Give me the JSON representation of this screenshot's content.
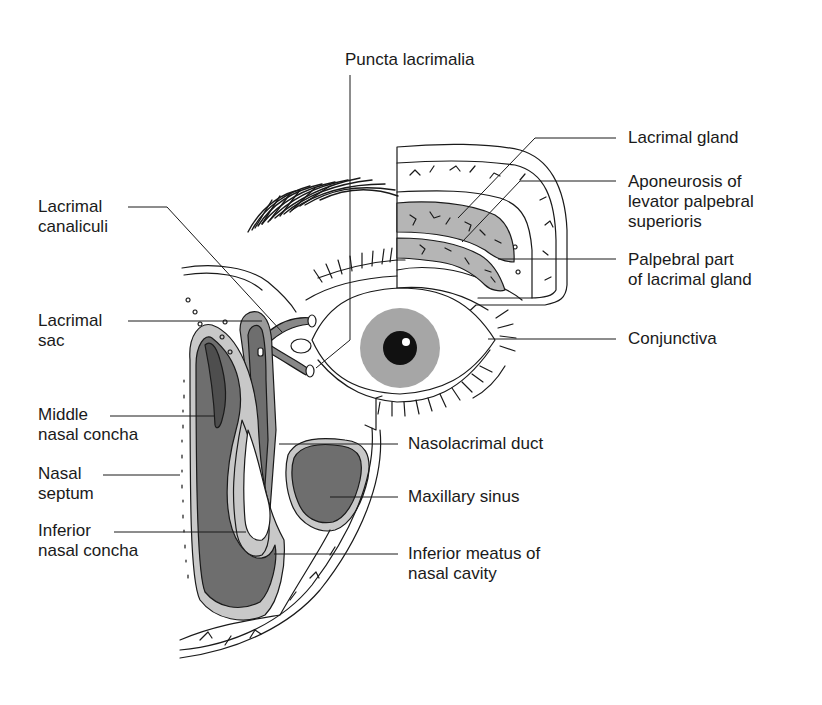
{
  "figure": {
    "colors": {
      "ink": "#1a1a1a",
      "mucosa_light": "#c8c8c8",
      "mucosa_mid": "#9a9a9a",
      "cavity_dark": "#6e6e6e",
      "cavity_darker": "#555555",
      "gland": "#b5b5b5",
      "iris": "#a6a6a6",
      "pupil": "#111111",
      "background": "#ffffff"
    }
  },
  "labels": {
    "puncta_lacrimalia": "Puncta lacrimalia",
    "lacrimal_gland": "Lacrimal gland",
    "aponeurosis": "Aponeurosis of\nlevator palpebral\nsuperioris",
    "palpebral_part": "Palpebral part\nof lacrimal gland",
    "conjunctiva": "Conjunctiva",
    "lacrimal_canaliculi": "Lacrimal\ncanaliculi",
    "lacrimal_sac": "Lacrimal\nsac",
    "middle_nasal_concha": "Middle\nnasal concha",
    "nasal_septum": "Nasal\nseptum",
    "inferior_nasal_concha": "Inferior\nnasal concha",
    "nasolacrimal_duct": "Nasolacrimal duct",
    "maxillary_sinus": "Maxillary sinus",
    "inferior_meatus": "Inferior meatus of\nnasal cavity"
  }
}
